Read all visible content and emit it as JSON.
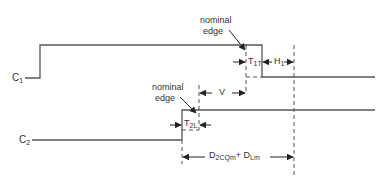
{
  "diagram": {
    "type": "timing-diagram",
    "signals": [
      {
        "name": "C",
        "subscript": "1"
      },
      {
        "name": "C",
        "subscript": "2"
      }
    ],
    "annotations": {
      "c1_nominal_edge": {
        "line1": "nominal",
        "line2": "edge"
      },
      "c2_nominal_edge": {
        "line1": "nominal",
        "line2": "edge"
      },
      "t1t": {
        "main": "T",
        "sub": "1T"
      },
      "h1": {
        "main": "H",
        "sub": "1"
      },
      "v": {
        "main": "V"
      },
      "t2l": {
        "main": "T",
        "sub": "2L"
      },
      "delay": {
        "main1": "D",
        "sub1": "2CQm",
        "plus": "+",
        "main2": "D",
        "sub2": "Lm"
      }
    },
    "colors": {
      "line": "#555555",
      "text": "#333333",
      "background": "#ffffff"
    }
  }
}
